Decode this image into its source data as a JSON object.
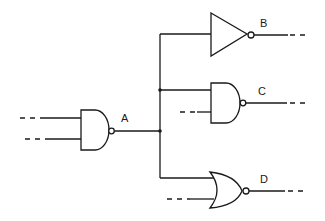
{
  "diagram": {
    "type": "logic-circuit",
    "gates": [
      {
        "id": "A",
        "label": "A",
        "kind": "NAND",
        "inputs": 2
      },
      {
        "id": "B",
        "label": "B",
        "kind": "NOT",
        "inputs": 1
      },
      {
        "id": "C",
        "label": "C",
        "kind": "NAND",
        "inputs": 2
      },
      {
        "id": "D",
        "label": "D",
        "kind": "NOR",
        "inputs": 2
      }
    ],
    "connections": [
      {
        "from": "A.out",
        "to": "B.in"
      },
      {
        "from": "A.out",
        "to": "C.in1"
      },
      {
        "from": "A.out",
        "to": "D.in1"
      }
    ],
    "colors": {
      "line": "#1a1a1a",
      "background": "#ffffff"
    }
  }
}
